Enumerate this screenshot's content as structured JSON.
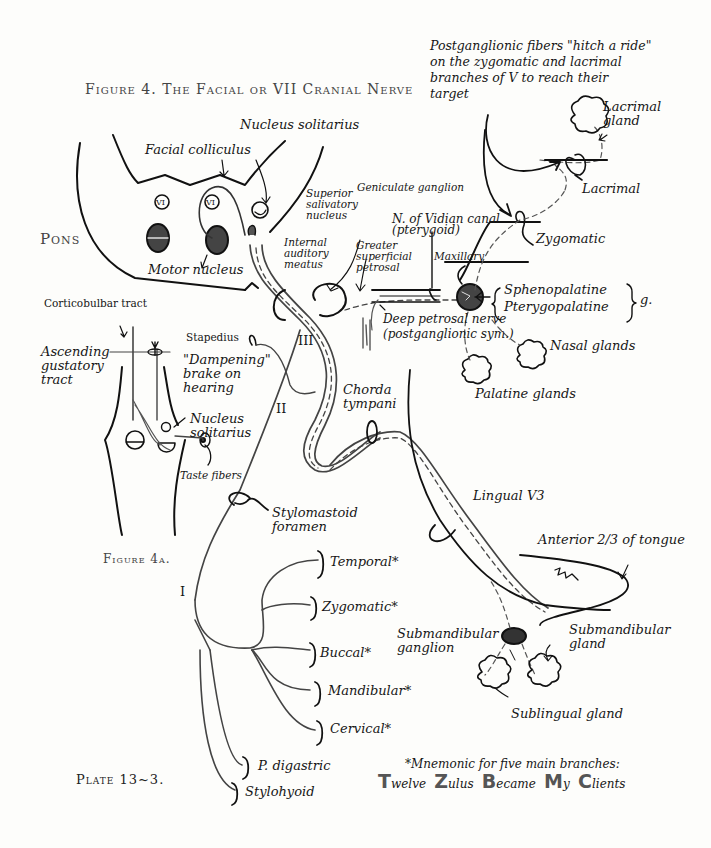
{
  "title": "Figure 4. The Facial or VII Cranial Nerve",
  "plate": "Plate 13~3.",
  "figure_4a": "Figure 4a.",
  "pons": {
    "label": "Pons",
    "facial_colliculus": "Facial colliculus",
    "nucleus_solitarius": "Nucleus solitarius",
    "motor_nucleus": "Motor nucleus",
    "abducens_left": "VI",
    "abducens_right": "VI",
    "superior_salivatory_nucleus": "Superior\nsalivatory\nnucleus",
    "internal_auditory_meatus": "Internal\nauditory\nmeatus"
  },
  "ganglia": {
    "geniculate": "Geniculate ganglion",
    "greater_superficial_petrosal": "Greater\nsuperficial\npetrosal",
    "vidian": "N. of Vidian canal\n(pterygoid)",
    "maxillary": "Maxillary",
    "deep_petrosal": "Deep petrosal nerve\n(postganglionic sym.)",
    "sphenopalatine": "Sphenopalatine",
    "pterygopalatine": "Pterygopalatine",
    "g_suffix": "g."
  },
  "trigeminal_branches": {
    "note": "Postganglionic fibers \"hitch a ride\"\non the zygomatic and lacrimal\nbranches of V to reach their\ntarget",
    "lacrimal_gland": "Lacrimal\ngland",
    "lacrimal": "Lacrimal",
    "zygomatic": "Zygomatic",
    "nasal_glands": "Nasal glands",
    "palatine_glands": "Palatine glands"
  },
  "figure4a_labels": {
    "corticobulbar": "Corticobulbar tract",
    "ascending_gustatory": "Ascending\ngustatory\ntract",
    "stapedius": "Stapedius",
    "dampening": "\"Dampening\"\nbrake on\nhearing",
    "nucleus_solitarius": "Nucleus\nsolitarius",
    "taste_fibers": "Taste fibers"
  },
  "segments": {
    "III": "III",
    "II": "II",
    "I": "I"
  },
  "chorda": {
    "chorda_tympani": "Chorda\ntympani",
    "lingual": "Lingual V3",
    "anterior_tongue": "Anterior 2/3 of tongue",
    "submandibular_ganglion": "Submandibular\nganglion",
    "submandibular_gland": "Submandibular\ngland",
    "sublingual_gland": "Sublingual gland"
  },
  "exit": {
    "stylomastoid": "Stylomastoid\nforamen"
  },
  "branches": [
    {
      "label": "Temporal*"
    },
    {
      "label": "Zygomatic*"
    },
    {
      "label": "Buccal*"
    },
    {
      "label": "Mandibular*"
    },
    {
      "label": "Cervical*"
    },
    {
      "label": "P. digastric"
    },
    {
      "label": "Stylohyoid"
    }
  ],
  "mnemonic": {
    "heading": "*Mnemonic for five main branches:",
    "words": [
      {
        "initial": "T",
        "rest": "welve"
      },
      {
        "initial": "Z",
        "rest": "ulus"
      },
      {
        "initial": "B",
        "rest": "ecame"
      },
      {
        "initial": "M",
        "rest": "y"
      },
      {
        "initial": "C",
        "rest": "lients"
      }
    ]
  }
}
